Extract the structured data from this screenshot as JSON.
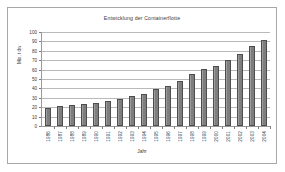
{
  "chart_data": {
    "type": "bar",
    "title": "Entwicklung der Containerflotte",
    "xlabel": "Jahr",
    "ylabel": "Mio. t dw",
    "ylim": [
      0,
      100
    ],
    "yticks": [
      0,
      10,
      20,
      30,
      40,
      50,
      60,
      70,
      80,
      90,
      100
    ],
    "grid": true,
    "legend": null,
    "bar_color": "#8a8a8a",
    "bar_edge_color": "#4d4d4d",
    "categories": [
      "1986",
      "1987",
      "1988",
      "1989",
      "1990",
      "1991",
      "1992",
      "1993",
      "1994",
      "1995",
      "1996",
      "1997",
      "1998",
      "1999",
      "2000",
      "2001",
      "2002",
      "2003",
      "2004"
    ],
    "values": [
      19,
      21,
      22,
      23,
      25,
      27,
      29,
      32,
      34,
      39,
      43,
      48,
      55,
      61,
      64,
      70,
      77,
      85,
      91
    ]
  }
}
